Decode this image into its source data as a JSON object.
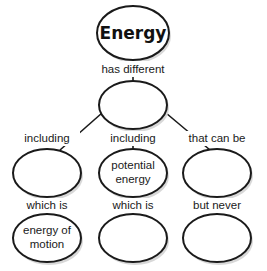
{
  "diagram": {
    "type": "concept-map",
    "root": {
      "label": "Energy"
    },
    "link_root": "has different",
    "middle": {
      "label": ""
    },
    "branches": [
      {
        "link_top": "including",
        "node_top": [
          "",
          ""
        ],
        "link_bottom": "which is",
        "node_bottom": [
          "energy of",
          "motion"
        ]
      },
      {
        "link_top": "including",
        "node_top": [
          "potential",
          "energy"
        ],
        "link_bottom": "which is",
        "node_bottom": [
          "",
          ""
        ]
      },
      {
        "link_top": "that can be",
        "node_top": [
          "",
          ""
        ],
        "link_bottom": "but never",
        "node_bottom": [
          "",
          ""
        ]
      }
    ]
  }
}
